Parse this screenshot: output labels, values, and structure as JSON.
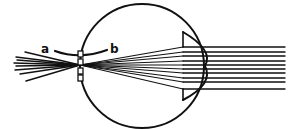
{
  "diagram": {
    "title": "",
    "labels": {
      "a": "a",
      "b": "b"
    },
    "colors": {
      "line": "#111111",
      "background": "#ffffff"
    },
    "eyeball": {
      "cx": 142,
      "cy": 66,
      "r": 62
    },
    "cornea_bulge": {
      "top_y": 32,
      "bottom_y": 100,
      "left_x": 183,
      "apex_x": 205
    },
    "incoming_parallel_rays_y": [
      47,
      52,
      56,
      61,
      65,
      69,
      73,
      78,
      82,
      89
    ],
    "incoming_rays_x_range": [
      183,
      285
    ],
    "focal_point": {
      "x": 80,
      "y": 65
    },
    "diverging_rays_left_endpoints": [
      [
        25,
        52
      ],
      [
        16,
        57
      ],
      [
        17,
        60
      ],
      [
        14,
        63
      ],
      [
        16,
        66
      ],
      [
        15,
        70
      ],
      [
        20,
        74
      ],
      [
        26,
        81
      ]
    ],
    "arc_ab": {
      "start": [
        55,
        51
      ],
      "control": [
        80,
        58
      ],
      "end": [
        107,
        50
      ]
    },
    "retina_markers_y": [
      54,
      62,
      71,
      78
    ]
  }
}
